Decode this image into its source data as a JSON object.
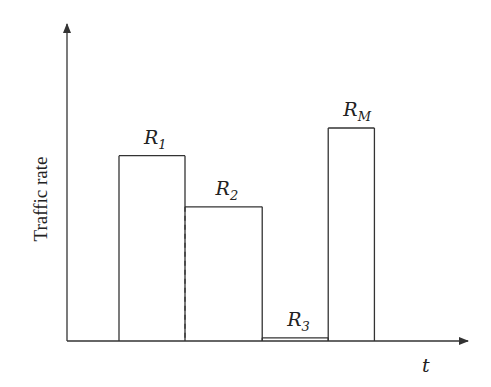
{
  "diagram": {
    "type": "step-bar",
    "y_axis_label": "Traffic rate",
    "x_axis_label": "t",
    "line_color": "#333333",
    "bars": [
      {
        "id": "R1",
        "base": "R",
        "subscript": "1",
        "start": 0,
        "end": 1,
        "rate": 0.87
      },
      {
        "id": "R2",
        "base": "R",
        "subscript": "2",
        "start": 1,
        "end": 2.17,
        "rate": 0.63,
        "left_edge": "dashed"
      },
      {
        "id": "R3",
        "base": "R",
        "subscript": "3",
        "start": 2.17,
        "end": 3.17,
        "rate": 0.015
      },
      {
        "id": "RM",
        "base": "R",
        "subscript": "M",
        "start": 3.17,
        "end": 3.87,
        "rate": 1.0
      }
    ]
  }
}
